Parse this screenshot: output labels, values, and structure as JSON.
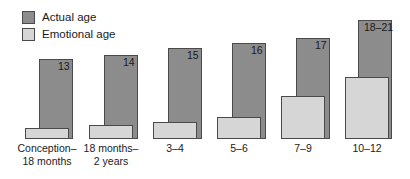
{
  "legend": {
    "items": [
      {
        "label": "Actual age",
        "color": "#8c8c8c",
        "key": "actual"
      },
      {
        "label": "Emotional age",
        "color": "#d6d6d6",
        "key": "emotional"
      }
    ]
  },
  "chart_data": {
    "type": "bar",
    "title": "",
    "subtitle": "",
    "xlabel": "",
    "ylabel": "",
    "grid": false,
    "legend_position": "top-left",
    "axis_baseline": true,
    "categories": [
      "Conception–\n18 months",
      "18 months–\n2 years",
      "3–4",
      "5–6",
      "7–9",
      "10–12"
    ],
    "series": [
      {
        "name": "Actual age",
        "color": "#8c8c8c",
        "value_labels": [
          "13",
          "14",
          "15",
          "16",
          "17",
          "18–21"
        ],
        "values": [
          13,
          14,
          15,
          16,
          17,
          19.5
        ]
      },
      {
        "name": "Emotional age",
        "color": "#d6d6d6",
        "value_labels": [
          "",
          "",
          "",
          "",
          "",
          ""
        ],
        "values": [
          1.4,
          1.9,
          2.4,
          3.0,
          6.1,
          8.5
        ]
      }
    ],
    "ylim": [
      0,
      21.5
    ]
  },
  "geometry": {
    "baseline_y": 139,
    "actual_bars": [
      {
        "x": 39,
        "y": 59,
        "w": 34,
        "h": 80
      },
      {
        "x": 104,
        "y": 55,
        "w": 34,
        "h": 84
      },
      {
        "x": 168,
        "y": 48,
        "w": 34,
        "h": 91
      },
      {
        "x": 232,
        "y": 43,
        "w": 34,
        "h": 96
      },
      {
        "x": 296,
        "y": 38,
        "w": 34,
        "h": 101
      },
      {
        "x": 358,
        "y": 20,
        "w": 34,
        "h": 119
      }
    ],
    "emotional_bars": [
      {
        "x": 25,
        "y": 128,
        "w": 44,
        "h": 11
      },
      {
        "x": 89,
        "y": 125,
        "w": 44,
        "h": 14
      },
      {
        "x": 153,
        "y": 122,
        "w": 44,
        "h": 17
      },
      {
        "x": 217,
        "y": 117,
        "w": 44,
        "h": 22
      },
      {
        "x": 281,
        "y": 96,
        "w": 44,
        "h": 43
      },
      {
        "x": 345,
        "y": 77,
        "w": 44,
        "h": 62
      }
    ],
    "value_label_pos": [
      {
        "x": 58,
        "y": 61
      },
      {
        "x": 123,
        "y": 57
      },
      {
        "x": 187,
        "y": 50
      },
      {
        "x": 251,
        "y": 45
      },
      {
        "x": 315,
        "y": 40
      },
      {
        "x": 364,
        "y": 22
      }
    ],
    "cat_label_pos": [
      {
        "cx": 47,
        "y": 142,
        "w": 82
      },
      {
        "cx": 111,
        "y": 142,
        "w": 82
      },
      {
        "cx": 175,
        "y": 142,
        "w": 82
      },
      {
        "cx": 239,
        "y": 142,
        "w": 82
      },
      {
        "cx": 303,
        "y": 142,
        "w": 82
      },
      {
        "cx": 367,
        "y": 142,
        "w": 82
      }
    ]
  }
}
